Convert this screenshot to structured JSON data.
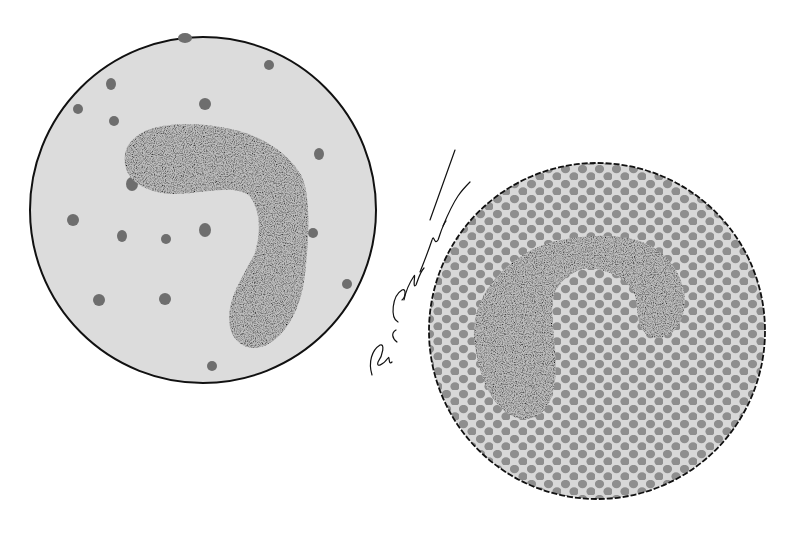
{
  "illustration": {
    "left_panel": {
      "description": "Band (stab) cell nucleus in a sparse field with scattered dots",
      "background": "#dcdcdc",
      "outline": "#111111",
      "dot_color": "#6e6e6e",
      "circle": {
        "cx": 203,
        "cy": 210,
        "r": 173
      },
      "dots": [
        [
          185,
          38,
          9,
          7
        ],
        [
          269,
          65,
          6,
          6
        ],
        [
          111,
          84,
          6,
          7
        ],
        [
          78,
          109,
          7,
          7
        ],
        [
          205,
          104,
          7,
          7
        ],
        [
          114,
          121,
          7,
          7
        ],
        [
          132,
          184,
          7,
          8
        ],
        [
          319,
          154,
          6,
          7
        ],
        [
          73,
          220,
          7,
          7
        ],
        [
          122,
          236,
          6,
          7
        ],
        [
          166,
          239,
          6,
          6
        ],
        [
          205,
          230,
          6,
          7
        ],
        [
          313,
          233,
          6,
          6
        ],
        [
          347,
          284,
          5,
          6
        ],
        [
          99,
          300,
          7,
          7
        ],
        [
          165,
          299,
          6,
          7
        ],
        [
          212,
          366,
          6,
          6
        ]
      ]
    },
    "right_panel": {
      "description": "Band cell nucleus in a dense field of packed cells",
      "background": "#d8d8d8",
      "cell_color": "#8e8e8e",
      "outline": "#111111",
      "circle": {
        "cx": 597,
        "cy": 331,
        "r": 168
      }
    },
    "nucleus_color": "#3a3a3a",
    "signature": {
      "text": "Dave E Christensen",
      "color": "#111111"
    }
  }
}
